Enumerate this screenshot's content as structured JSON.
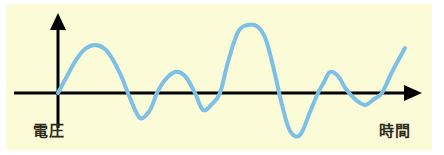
{
  "figure": {
    "background_color": "#ffffff",
    "panel_color": "#fcfbd8"
  },
  "axes": {
    "y_axis": {
      "name": "vertical-axis",
      "label": "電圧",
      "meaning": "voltage",
      "color": "#000000",
      "arrow": "up-arrow"
    },
    "x_axis": {
      "name": "horizontal-axis",
      "label": "時間",
      "meaning": "time",
      "color": "#000000",
      "arrow": "right-arrow"
    }
  },
  "chart_data": {
    "type": "line",
    "title": "",
    "xlabel": "時間",
    "ylabel": "電圧",
    "grid": false,
    "legend": false,
    "series": [
      {
        "name": "waveform",
        "color": "#7cc0e8",
        "line_width": 4,
        "x": [
          58,
          66,
          76,
          85,
          95,
          105,
          113,
          122,
          130,
          140,
          150,
          157,
          165,
          175,
          185,
          195,
          203,
          212,
          220,
          228,
          238,
          248,
          258,
          266,
          274,
          282,
          290,
          300,
          310,
          318,
          324,
          330,
          338,
          346,
          356,
          365,
          374,
          382,
          392,
          405
        ],
        "y": [
          93,
          78,
          60,
          49,
          45,
          49,
          60,
          78,
          98,
          118,
          110,
          93,
          80,
          72,
          76,
          93,
          110,
          104,
          93,
          62,
          32,
          25,
          27,
          40,
          70,
          105,
          131,
          135,
          112,
          93,
          82,
          72,
          76,
          89,
          100,
          105,
          99,
          93,
          72,
          48
        ]
      }
    ],
    "y_zero_line": 93,
    "xlim": [
      58,
      420
    ],
    "ylim_pixels": [
      15,
      145
    ]
  }
}
